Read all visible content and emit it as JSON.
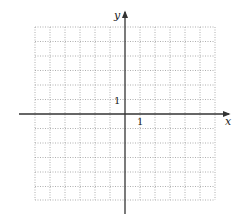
{
  "diagram": {
    "type": "coordinate-grid",
    "axes": {
      "x_label": "x",
      "y_label": "y",
      "x_tick_label": "1",
      "y_tick_label": "1"
    },
    "grid": {
      "columns": 12,
      "rows": 12,
      "style": "dotted",
      "x_range": [
        -6,
        6
      ],
      "y_range": [
        -6,
        6
      ]
    },
    "colors": {
      "grid": "#9a9a9a",
      "axis": "#333333",
      "background": "#ffffff"
    }
  }
}
